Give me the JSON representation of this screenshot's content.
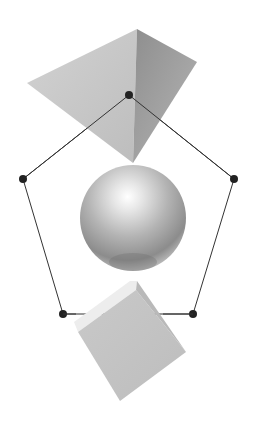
{
  "diagram": {
    "title": "",
    "background": "#ffffff",
    "shapes": [
      {
        "name": "pyramid",
        "kind": "3d-shape",
        "color": "#c4c4c4"
      },
      {
        "name": "sphere",
        "kind": "3d-shape",
        "color": "#bcbcbc"
      },
      {
        "name": "cube",
        "kind": "3d-shape",
        "color": "#c6c6c6"
      }
    ],
    "pentagon": {
      "stroke": "#333333",
      "node_color": "#222222",
      "nodes": [
        {
          "id": "top",
          "x": 129,
          "y": 95
        },
        {
          "id": "right",
          "x": 234,
          "y": 179
        },
        {
          "id": "bottom-right",
          "x": 193,
          "y": 314
        },
        {
          "id": "bottom-left",
          "x": 63,
          "y": 314
        },
        {
          "id": "left",
          "x": 23,
          "y": 179
        }
      ]
    }
  }
}
